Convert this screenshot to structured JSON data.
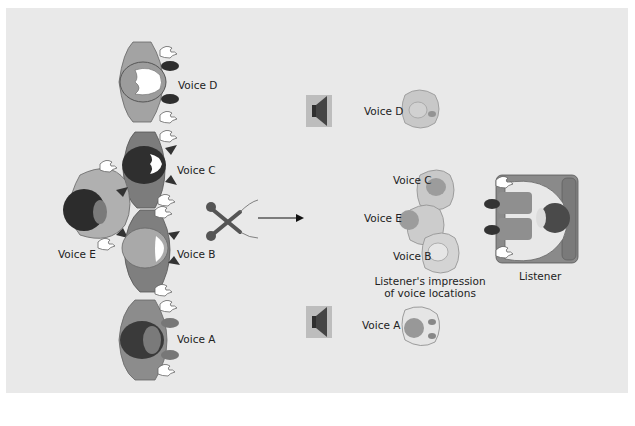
{
  "figure": {
    "background_color": "#e9e9e9",
    "figure_colors": {
      "light_body": "#a9a9a9",
      "medium_body": "#8a8a8a",
      "dark_hair": "#3a3a3a",
      "hand": "#ffffff",
      "outline": "#555555"
    }
  },
  "performers": {
    "voice_d": {
      "label": "Voice D"
    },
    "voice_c": {
      "label": "Voice C"
    },
    "voice_e": {
      "label": "Voice E"
    },
    "voice_b": {
      "label": "Voice B"
    },
    "voice_a": {
      "label": "Voice A"
    }
  },
  "microphone": {
    "icon": "crossed-stereo-microphones-icon"
  },
  "arrow": {
    "icon": "right-arrow-icon"
  },
  "speakers": [
    {
      "icon": "loudspeaker-icon",
      "position": "top"
    },
    {
      "icon": "loudspeaker-icon",
      "position": "bottom"
    }
  ],
  "perceived": {
    "voice_d": {
      "label": "Voice D"
    },
    "voice_c": {
      "label": "Voice C"
    },
    "voice_e": {
      "label": "Voice E"
    },
    "voice_b": {
      "label": "Voice B"
    },
    "voice_a": {
      "label": "Voice A"
    },
    "caption_line1": "Listener's impression",
    "caption_line2": "of voice locations"
  },
  "listener": {
    "label": "Listener"
  }
}
